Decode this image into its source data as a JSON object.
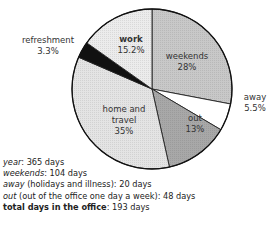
{
  "chart_data": {
    "type": "pie",
    "title": "",
    "slices": [
      {
        "label": "weekends",
        "value": 28,
        "display": "28%",
        "color": "#c8c8c8"
      },
      {
        "label": "away",
        "value": 5.5,
        "display": "5.5%",
        "color": "#ffffff"
      },
      {
        "label": "out",
        "value": 13,
        "display": "13%",
        "color": "#a8a8a8"
      },
      {
        "label": "home and travel",
        "value": 35,
        "display": "35%",
        "color": "#e4e4e4"
      },
      {
        "label": "refreshment",
        "value": 3.3,
        "display": "3.3%",
        "color": "#111111"
      },
      {
        "label": "work",
        "value": 15.2,
        "display": "15.2%",
        "color": "#ececec"
      }
    ],
    "start_angle_deg": 0,
    "direction": "clockwise",
    "notes": [
      {
        "key": "year",
        "value": "365 days"
      },
      {
        "key": "weekends",
        "value": "104 days"
      },
      {
        "key": "away (holidays and illness)",
        "value": "20 days"
      },
      {
        "key": "out (out of the office one day a week)",
        "value": "48 days"
      },
      {
        "key": "total days in the office",
        "value": "193 days"
      }
    ]
  },
  "labels": {
    "work_name": "work",
    "work_pct": "15.2%",
    "weekends_name": "weekends",
    "weekends_pct": "28%",
    "away_name": "away",
    "away_pct": "5.5%",
    "out_name": "out",
    "out_pct": "13%",
    "home_name1": "home and",
    "home_name2": "travel",
    "home_pct": "35%",
    "refresh_name": "refreshment",
    "refresh_pct": "3.3%"
  },
  "notes": {
    "year_key": "year",
    "year_val": ": 365 days",
    "weekends_key": "weekends",
    "weekends_val": ": 104 days",
    "away_key": "away",
    "away_val": " (holidays and illness): 20 days",
    "out_key": "out",
    "out_val": " (out of the office one day a week): 48 days",
    "total_key": "total days in the office",
    "total_val": ": 193 days"
  }
}
